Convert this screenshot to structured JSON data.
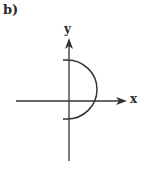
{
  "figure": {
    "panel_label": "b)",
    "x_axis_label": "x",
    "y_axis_label": "y",
    "curve": "right half of a circle (semicircle) crossing the x-axis, centered slightly above origin",
    "colors": {
      "stroke": "#333333",
      "background": "#ffffff"
    }
  }
}
